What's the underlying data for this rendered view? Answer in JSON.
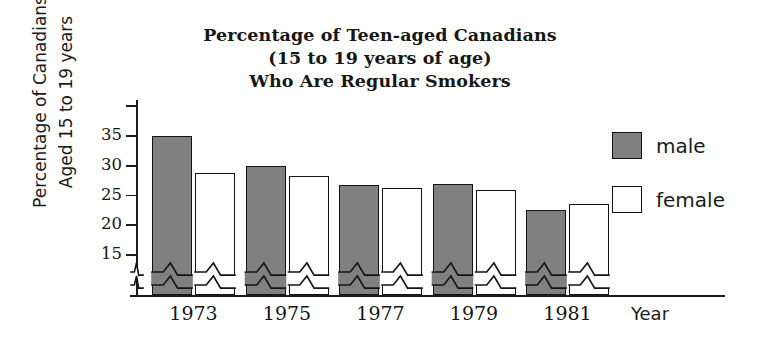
{
  "chart_data": {
    "type": "bar",
    "title": "Percentage of Teen-aged Canadians (15 to 19 years of age) Who Are Regular Smokers",
    "title_lines": [
      "Percentage of Teen-aged Canadians",
      "(15 to 19 years of age)",
      "Who Are Regular Smokers"
    ],
    "xlabel": "Year",
    "ylabel": "Percentage of Canadians Aged 15 to 19 years",
    "ylabel_lines": [
      "Percentage of Canadians",
      "Aged 15 to 19 years"
    ],
    "categories": [
      "1973",
      "1975",
      "1977",
      "1979",
      "1981"
    ],
    "series": [
      {
        "name": "male",
        "color": "#808080",
        "values": [
          35.0,
          30.0,
          26.8,
          26.9,
          22.5
        ]
      },
      {
        "name": "female",
        "color": "#ffffff",
        "values": [
          28.7,
          28.2,
          26.2,
          25.9,
          23.5
        ]
      }
    ],
    "ytick_labels": [
      "35",
      "30",
      "25",
      "20",
      "15"
    ],
    "ytick_values": [
      35,
      30,
      25,
      20,
      15
    ],
    "ylim": [
      12.5,
      37.5
    ],
    "axis_break": true,
    "grid": false,
    "legend_position": "right",
    "legend": [
      {
        "label": "male",
        "swatch": "filled-gray"
      },
      {
        "label": "female",
        "swatch": "outline-white"
      }
    ]
  },
  "colors": {
    "bar_fill_male": "#808080",
    "bar_fill_female": "#ffffff",
    "outline": "#141414",
    "background": "#ffffff",
    "text": "#1a1a1a"
  }
}
